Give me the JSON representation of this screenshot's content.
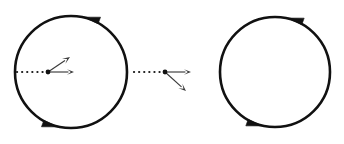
{
  "figure": {
    "type": "diagram",
    "title": "",
    "canvas": {
      "width": 344,
      "height": 144,
      "background": "#ffffff"
    },
    "stroke_color": "#111111",
    "dotted_color": "#1a1a1a",
    "vector_color": "#3a3a3a",
    "objects": [
      {
        "id": "left-circle",
        "kind": "circle",
        "center_x": 71,
        "center_y": 72,
        "radius": 56,
        "stroke_width": 2.6,
        "rotation_sense": "counterclockwise",
        "arrowheads": [
          {
            "id": "left-circle-top-arrowhead",
            "position_angle_deg": 70,
            "points": "left"
          },
          {
            "id": "left-circle-bottom-arrowhead",
            "position_angle_deg": 250,
            "points": "right"
          }
        ]
      },
      {
        "id": "left-dotted-radius",
        "kind": "dotted-line",
        "x1": 17,
        "y1": 72,
        "x2": 48,
        "y2": 72,
        "dot_count": 7
      },
      {
        "id": "left-origin-dot",
        "kind": "dot",
        "cx": 48,
        "cy": 72,
        "r": 2.4
      },
      {
        "id": "left-vector-horizontal",
        "kind": "vector-arrow",
        "x1": 48,
        "y1": 72,
        "x2": 74,
        "y2": 72,
        "direction": "right"
      },
      {
        "id": "left-vector-upright",
        "kind": "vector-arrow",
        "x1": 48,
        "y1": 72,
        "x2": 70,
        "y2": 57,
        "direction": "up-right"
      },
      {
        "id": "right-dotted-radius",
        "kind": "dotted-line",
        "x1": 134,
        "y1": 72,
        "x2": 165,
        "y2": 72,
        "dot_count": 7
      },
      {
        "id": "right-origin-dot",
        "kind": "dot",
        "cx": 165,
        "cy": 72,
        "r": 2.4
      },
      {
        "id": "right-vector-horizontal",
        "kind": "vector-arrow",
        "x1": 165,
        "y1": 72,
        "x2": 191,
        "y2": 72,
        "direction": "right"
      },
      {
        "id": "right-vector-downright",
        "kind": "vector-arrow",
        "x1": 165,
        "y1": 72,
        "x2": 186,
        "y2": 91,
        "direction": "down-right"
      },
      {
        "id": "right-circle",
        "kind": "circle",
        "center_x": 275,
        "center_y": 72,
        "radius": 55,
        "stroke_width": 2.6,
        "rotation_sense": "counterclockwise",
        "arrowheads": [
          {
            "id": "right-circle-top-arrowhead",
            "position_angle_deg": 70,
            "points": "left"
          },
          {
            "id": "right-circle-bottom-arrowhead",
            "position_angle_deg": 250,
            "points": "right"
          }
        ]
      }
    ]
  }
}
